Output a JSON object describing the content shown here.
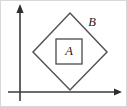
{
  "figure": {
    "background_color": "#ffffff",
    "stroke_color": "#555555",
    "axis_color": "#3a3a3a",
    "label_color": "#1a1a1a"
  },
  "axes": {
    "x_axis": {
      "name": "x-axis",
      "y": 92,
      "x_start": 8,
      "x_end": 122,
      "arrow": "right"
    },
    "y_axis": {
      "name": "y-axis",
      "x": 20,
      "y_start": 101,
      "y_end": 4,
      "arrow": "up"
    },
    "origin": {
      "x": 20,
      "y": 92
    }
  },
  "shapes": {
    "outer": {
      "name": "diamond",
      "label": "B",
      "points": "70,13 107,52 70,90 33,52",
      "vertices": {
        "top": {
          "x": 70,
          "y": 13
        },
        "right": {
          "x": 107,
          "y": 52
        },
        "bottom": {
          "x": 70,
          "y": 90
        },
        "left": {
          "x": 33,
          "y": 52
        }
      },
      "label_position": {
        "x": 92,
        "y": 23
      }
    },
    "inner": {
      "name": "square",
      "label": "A",
      "x": 56,
      "y": 39,
      "width": 26,
      "height": 25,
      "label_position": {
        "x": 69,
        "y": 52
      }
    }
  }
}
